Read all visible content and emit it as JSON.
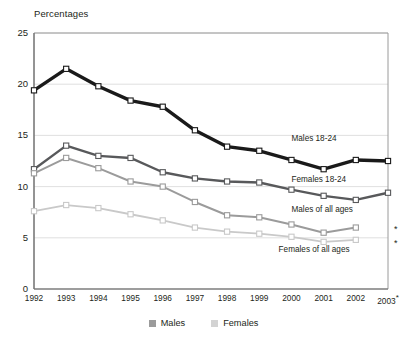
{
  "chart_data": {
    "type": "line",
    "title": "",
    "subtitle": "",
    "ylabel": "Percentages",
    "xlabel": "",
    "ylim": [
      0,
      25
    ],
    "yticks": [
      0,
      5,
      10,
      15,
      20,
      25
    ],
    "grid": true,
    "grid_axis": "y",
    "legend_position": "bottom",
    "categories": [
      "1992",
      "1993",
      "1994",
      "1995",
      "1996",
      "1997",
      "1998",
      "1999",
      "2000",
      "2001",
      "2002",
      "2003"
    ],
    "x_tick_labels": [
      "1992",
      "1993",
      "1994",
      "1995",
      "1996",
      "1997",
      "1998",
      "1999",
      "2000",
      "2001",
      "2002",
      "2003*"
    ],
    "series": [
      {
        "name": "Males 18-24",
        "color": "#1a1a1a",
        "marker": "square-open",
        "values": [
          19.4,
          21.5,
          19.8,
          18.4,
          17.8,
          15.5,
          13.9,
          13.5,
          12.6,
          11.7,
          12.6,
          12.5
        ]
      },
      {
        "name": "Females 18-24",
        "color": "#58595b",
        "marker": "square-open",
        "values": [
          11.7,
          14.0,
          13.0,
          12.8,
          11.4,
          10.8,
          10.5,
          10.4,
          9.7,
          9.1,
          8.7,
          9.4
        ]
      },
      {
        "name": "Males of all ages",
        "color": "#9b9b9b",
        "marker": "square-open",
        "values": [
          11.3,
          12.8,
          11.8,
          10.5,
          10.0,
          8.5,
          7.2,
          7.0,
          6.3,
          5.5,
          6.0,
          null
        ]
      },
      {
        "name": "Females of all ages",
        "color": "#c9c9c9",
        "marker": "square-open",
        "values": [
          7.6,
          8.2,
          7.9,
          7.3,
          6.7,
          6.0,
          5.6,
          5.4,
          5.1,
          4.6,
          4.8,
          null
        ]
      }
    ],
    "annotations": [
      {
        "name": "males-18-24-label",
        "text": "Males 18-24",
        "x": 2000.0,
        "y": 14.6
      },
      {
        "name": "females-18-24-label",
        "text": "Females 18-24",
        "x": 2000.0,
        "y": 10.6
      },
      {
        "name": "males-all-ages-label",
        "text": "Males of all ages",
        "x": 2000.0,
        "y": 7.7
      },
      {
        "name": "females-all-ages-label",
        "text": "Females of all ages",
        "x": 1999.6,
        "y": 3.8
      }
    ],
    "footnote_markers": [
      {
        "name": "asterisk-males-all-ages-2003",
        "symbol": "*",
        "near_value": 6.0
      },
      {
        "name": "asterisk-females-all-ages-2003",
        "symbol": "*",
        "near_value": 4.6
      }
    ]
  },
  "legend": {
    "items": [
      {
        "label": "Males",
        "color": "#9b9b9b"
      },
      {
        "label": "Females",
        "color": "#d3d3d3"
      }
    ]
  }
}
